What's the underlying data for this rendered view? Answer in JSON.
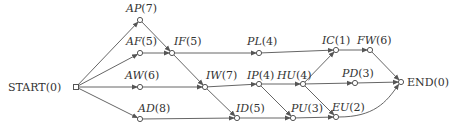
{
  "diagram": {
    "type": "activity-network",
    "nodes": [
      {
        "id": "START",
        "name": "START",
        "dur": "(0)",
        "italic": false,
        "x": 76,
        "y": 87,
        "lx": 8,
        "ly": 91,
        "anchor": "start"
      },
      {
        "id": "AP",
        "name": "AP",
        "dur": "(7)",
        "italic": true,
        "x": 140,
        "y": 20,
        "lx": 126,
        "ly": 12,
        "anchor": "start"
      },
      {
        "id": "AF",
        "name": "AF",
        "dur": "(5)",
        "italic": true,
        "x": 140,
        "y": 53,
        "lx": 126,
        "ly": 45,
        "anchor": "start"
      },
      {
        "id": "AW",
        "name": "AW",
        "dur": "(6)",
        "italic": true,
        "x": 140,
        "y": 87,
        "lx": 125,
        "ly": 79,
        "anchor": "start"
      },
      {
        "id": "AD",
        "name": "AD",
        "dur": "(8)",
        "italic": true,
        "x": 140,
        "y": 119,
        "lx": 138,
        "ly": 112,
        "anchor": "start"
      },
      {
        "id": "IF",
        "name": "IF",
        "dur": "(5)",
        "italic": true,
        "x": 172,
        "y": 53,
        "lx": 174,
        "ly": 45,
        "anchor": "start"
      },
      {
        "id": "PL",
        "name": "PL",
        "dur": "(4)",
        "italic": true,
        "x": 259,
        "y": 53,
        "lx": 247,
        "ly": 45,
        "anchor": "start"
      },
      {
        "id": "IW",
        "name": "IW",
        "dur": "(7)",
        "italic": true,
        "x": 205,
        "y": 87,
        "lx": 206,
        "ly": 79,
        "anchor": "start"
      },
      {
        "id": "IP",
        "name": "IP",
        "dur": "(4)",
        "italic": true,
        "x": 259,
        "y": 84,
        "lx": 247,
        "ly": 79,
        "anchor": "start"
      },
      {
        "id": "HU",
        "name": "HU",
        "dur": "(4)",
        "italic": true,
        "x": 303,
        "y": 84,
        "lx": 277,
        "ly": 79,
        "anchor": "start"
      },
      {
        "id": "ID",
        "name": "ID",
        "dur": "(5)",
        "italic": true,
        "x": 237,
        "y": 118,
        "lx": 236,
        "ly": 112,
        "anchor": "start"
      },
      {
        "id": "PU",
        "name": "PU",
        "dur": "(3)",
        "italic": true,
        "x": 293,
        "y": 118,
        "lx": 291,
        "ly": 112,
        "anchor": "start"
      },
      {
        "id": "IC",
        "name": "IC",
        "dur": "(1)",
        "italic": true,
        "x": 336,
        "y": 50,
        "lx": 322,
        "ly": 44,
        "anchor": "start"
      },
      {
        "id": "FW",
        "name": "FW",
        "dur": "(6)",
        "italic": true,
        "x": 370,
        "y": 50,
        "lx": 357,
        "ly": 44,
        "anchor": "start"
      },
      {
        "id": "PD",
        "name": "PD",
        "dur": "(3)",
        "italic": true,
        "x": 355,
        "y": 83,
        "lx": 342,
        "ly": 77,
        "anchor": "start"
      },
      {
        "id": "EU",
        "name": "EU",
        "dur": "(2)",
        "italic": true,
        "x": 336,
        "y": 117,
        "lx": 332,
        "ly": 111,
        "anchor": "start"
      },
      {
        "id": "END",
        "name": "END",
        "dur": "(0)",
        "italic": false,
        "x": 401,
        "y": 82,
        "lx": 407,
        "ly": 86,
        "anchor": "start"
      }
    ],
    "edges": [
      [
        "START",
        "AP"
      ],
      [
        "START",
        "AF"
      ],
      [
        "START",
        "AW"
      ],
      [
        "START",
        "AD"
      ],
      [
        "AP",
        "IF"
      ],
      [
        "AF",
        "IF"
      ],
      [
        "IF",
        "PL"
      ],
      [
        "IF",
        "IW"
      ],
      [
        "AW",
        "IW"
      ],
      [
        "IW",
        "IP"
      ],
      [
        "IW",
        "ID"
      ],
      [
        "AD",
        "ID"
      ],
      [
        "PL",
        "IC"
      ],
      [
        "IP",
        "HU"
      ],
      [
        "IP",
        "PU"
      ],
      [
        "ID",
        "PU"
      ],
      [
        "HU",
        "IC"
      ],
      [
        "HU",
        "PD"
      ],
      [
        "HU",
        "EU"
      ],
      [
        "PU",
        "EU"
      ],
      [
        "IC",
        "FW"
      ],
      [
        "FW",
        "END"
      ],
      [
        "PD",
        "END"
      ],
      [
        "EU",
        "END"
      ]
    ],
    "colors": {
      "edge": "#666666",
      "node_stroke": "#555555",
      "label": "#333333"
    }
  }
}
